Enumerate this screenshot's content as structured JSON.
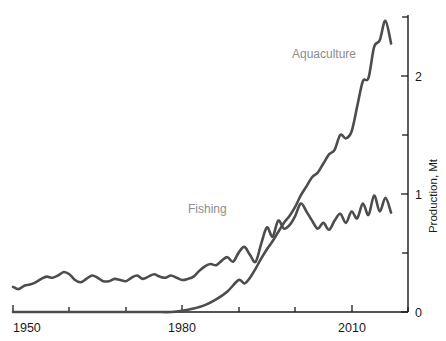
{
  "chart_data": {
    "type": "line",
    "title": "",
    "subtitle": "",
    "xlabel": "",
    "ylabel": "Production, Mt",
    "xlim": [
      1950,
      2020
    ],
    "ylim": [
      0,
      2.6
    ],
    "grid": false,
    "legend_position": "inline-annotation",
    "x_ticks_major": [
      1950,
      1980,
      2010
    ],
    "x_ticks_minor": [
      1960,
      1970,
      1990,
      2000,
      2020
    ],
    "x_tick_labels": [
      "1950",
      "1980",
      "2010"
    ],
    "y_ticks_major": [
      0,
      1,
      2
    ],
    "y_ticks_minor": [
      0.5,
      1.5,
      2.5
    ],
    "y_tick_labels": [
      "0",
      "1",
      "2"
    ],
    "axis_side": "right",
    "line_color": "#4d4d4d",
    "label_color": "#8d8d8d",
    "series": [
      {
        "name": "Fishing",
        "label": "Fishing",
        "color": "#4d4d4d",
        "x": [
          1950,
          1951,
          1952,
          1953,
          1954,
          1955,
          1956,
          1957,
          1958,
          1959,
          1960,
          1961,
          1962,
          1963,
          1964,
          1965,
          1966,
          1967,
          1968,
          1969,
          1970,
          1971,
          1972,
          1973,
          1974,
          1975,
          1976,
          1977,
          1978,
          1979,
          1980,
          1981,
          1982,
          1983,
          1984,
          1985,
          1986,
          1987,
          1988,
          1989,
          1990,
          1991,
          1992,
          1993,
          1994,
          1995,
          1996,
          1997,
          1998,
          1999,
          2000,
          2001,
          2002,
          2003,
          2004,
          2005,
          2006,
          2007,
          2008,
          2009,
          2010,
          2011,
          2012,
          2013,
          2014,
          2015,
          2016,
          2017
        ],
        "values": [
          0.22,
          0.2,
          0.23,
          0.24,
          0.26,
          0.29,
          0.31,
          0.3,
          0.32,
          0.35,
          0.33,
          0.28,
          0.26,
          0.29,
          0.32,
          0.3,
          0.27,
          0.27,
          0.29,
          0.28,
          0.27,
          0.3,
          0.32,
          0.29,
          0.31,
          0.33,
          0.31,
          0.3,
          0.32,
          0.3,
          0.28,
          0.29,
          0.31,
          0.36,
          0.4,
          0.42,
          0.41,
          0.45,
          0.48,
          0.44,
          0.52,
          0.57,
          0.5,
          0.44,
          0.6,
          0.74,
          0.66,
          0.8,
          0.73,
          0.76,
          0.84,
          0.95,
          0.88,
          0.8,
          0.73,
          0.78,
          0.72,
          0.8,
          0.86,
          0.78,
          0.88,
          0.82,
          0.95,
          0.85,
          1.02,
          0.88,
          1.0,
          0.87
        ]
      },
      {
        "name": "Aquaculture",
        "label": "Aquaculture",
        "color": "#4d4d4d",
        "x": [
          1950,
          1955,
          1960,
          1965,
          1970,
          1975,
          1978,
          1980,
          1982,
          1984,
          1986,
          1988,
          1990,
          1991,
          1992,
          1993,
          1994,
          1995,
          1996,
          1997,
          1998,
          1999,
          2000,
          2001,
          2002,
          2003,
          2004,
          2005,
          2006,
          2007,
          2008,
          2009,
          2010,
          2011,
          2012,
          2013,
          2014,
          2015,
          2016,
          2017
        ],
        "values": [
          0.0,
          0.0,
          0.0,
          0.0,
          0.0,
          0.0,
          0.0,
          0.01,
          0.03,
          0.06,
          0.11,
          0.18,
          0.28,
          0.25,
          0.3,
          0.38,
          0.47,
          0.55,
          0.62,
          0.7,
          0.78,
          0.84,
          0.92,
          1.02,
          1.1,
          1.18,
          1.22,
          1.3,
          1.38,
          1.42,
          1.55,
          1.52,
          1.58,
          1.8,
          2.02,
          2.05,
          2.32,
          2.38,
          2.55,
          2.35
        ]
      }
    ],
    "annotations": [
      {
        "text": "Aquaculture",
        "x": 2003,
        "y": 2.2
      },
      {
        "text": "Fishing",
        "x": 1987,
        "y": 0.95
      }
    ]
  }
}
